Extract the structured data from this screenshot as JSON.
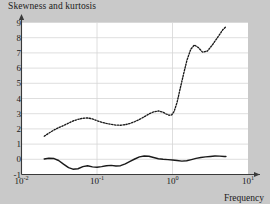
{
  "chart_data": {
    "type": "line",
    "title": "Skewness and kurtosis",
    "xlabel": "Frequency",
    "ylabel": "",
    "xscale": "log",
    "yscale": "linear",
    "xlim": [
      0.01,
      10
    ],
    "ylim": [
      -1,
      9
    ],
    "grid": true,
    "legend_position": "none",
    "xtick_labels": [
      "10",
      "10",
      "10",
      "10"
    ],
    "xtick_exponents": [
      "-2",
      "-1",
      "0",
      "1"
    ],
    "xtick_values": [
      0.01,
      0.1,
      1,
      10
    ],
    "ytick_labels": [
      "-1",
      "0",
      "1",
      "2",
      "3",
      "4",
      "5",
      "6",
      "7",
      "8",
      "9"
    ],
    "ytick_values": [
      -1,
      0,
      1,
      2,
      3,
      4,
      5,
      6,
      7,
      8,
      9
    ],
    "series": [
      {
        "name": "kurtosis",
        "style": "dotted",
        "color": "#1a1a1a",
        "x": [
          0.02,
          0.023,
          0.027,
          0.031,
          0.036,
          0.042,
          0.048,
          0.056,
          0.065,
          0.075,
          0.087,
          0.1,
          0.115,
          0.133,
          0.154,
          0.178,
          0.205,
          0.237,
          0.274,
          0.316,
          0.365,
          0.422,
          0.487,
          0.562,
          0.65,
          0.75,
          0.825,
          0.9,
          0.975,
          1.05,
          1.15,
          1.25,
          1.4,
          1.55,
          1.75,
          1.95,
          2.2,
          2.5,
          2.9,
          3.4,
          4.0,
          4.6,
          5.1
        ],
        "y": [
          1.52,
          1.72,
          1.93,
          2.08,
          2.22,
          2.38,
          2.52,
          2.63,
          2.7,
          2.72,
          2.66,
          2.54,
          2.44,
          2.36,
          2.3,
          2.25,
          2.24,
          2.28,
          2.36,
          2.48,
          2.62,
          2.8,
          2.98,
          3.12,
          3.18,
          3.1,
          2.98,
          2.9,
          2.92,
          3.15,
          3.75,
          4.55,
          5.6,
          6.5,
          7.25,
          7.52,
          7.35,
          7.05,
          7.12,
          7.55,
          8.05,
          8.5,
          8.72
        ]
      },
      {
        "name": "skewness",
        "style": "solid",
        "color": "#1a1a1a",
        "x": [
          0.02,
          0.023,
          0.027,
          0.031,
          0.036,
          0.042,
          0.048,
          0.056,
          0.065,
          0.075,
          0.087,
          0.1,
          0.115,
          0.133,
          0.154,
          0.178,
          0.205,
          0.237,
          0.274,
          0.316,
          0.365,
          0.422,
          0.487,
          0.562,
          0.65,
          0.75,
          0.87,
          1.0,
          1.15,
          1.33,
          1.54,
          1.78,
          2.05,
          2.37,
          2.74,
          3.16,
          3.65,
          4.22,
          4.87,
          5.1
        ],
        "y": [
          0.02,
          0.07,
          0.05,
          -0.08,
          -0.32,
          -0.55,
          -0.65,
          -0.62,
          -0.48,
          -0.42,
          -0.5,
          -0.52,
          -0.48,
          -0.42,
          -0.4,
          -0.44,
          -0.42,
          -0.3,
          -0.14,
          0.02,
          0.16,
          0.22,
          0.2,
          0.12,
          0.04,
          0.0,
          -0.02,
          -0.04,
          -0.08,
          -0.12,
          -0.1,
          -0.02,
          0.06,
          0.12,
          0.16,
          0.19,
          0.22,
          0.21,
          0.18,
          0.18
        ]
      }
    ]
  },
  "colors": {
    "page_background": "#c9c9c9",
    "plot_background": "#ffffff",
    "grid": "#d6d6d6",
    "axis": "#3a3a3a",
    "text": "#1a1a1a"
  }
}
